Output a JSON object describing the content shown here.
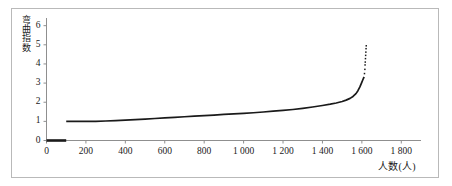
{
  "figure": {
    "background_color": "#ffffff",
    "frame_color": "#b9b9b9",
    "ink_color": "#1a1a1a"
  },
  "axes": {
    "x_title": "人数(人)",
    "y_title": "弯曲指数",
    "y_title_chars": [
      "弯",
      "曲",
      "指",
      "数"
    ],
    "x_tick_labels": [
      "0",
      "200",
      "400",
      "600",
      "800",
      "1 000",
      "1 200",
      "1 400",
      "1 600",
      "1 800"
    ],
    "y_tick_labels": [
      "0",
      "1",
      "2",
      "3",
      "4",
      "5",
      "6"
    ]
  },
  "chart_data": {
    "type": "line",
    "title": "",
    "subtitle": "",
    "xlabel": "人数(人)",
    "ylabel": "弯曲指数",
    "xlim": [
      0,
      1900
    ],
    "ylim": [
      0,
      6.4
    ],
    "xticks": [
      0,
      200,
      400,
      600,
      800,
      1000,
      1200,
      1400,
      1600,
      1800
    ],
    "xticklabels": [
      "0",
      "200",
      "400",
      "600",
      "800",
      "1 000",
      "1 200",
      "1 400",
      "1 600",
      "1 800"
    ],
    "yticks": [
      0,
      1,
      2,
      3,
      4,
      5,
      6
    ],
    "yticklabels": [
      "0",
      "1",
      "2",
      "3",
      "4",
      "5",
      "6"
    ],
    "grid": false,
    "legend": null,
    "legend_position": "none",
    "line_color": "#1a1a1a",
    "series": [
      {
        "name": "baseline-zero-segment",
        "style": "thick-solid",
        "x": [
          0,
          20,
          40,
          60,
          80,
          100
        ],
        "values": [
          0,
          0,
          0,
          0,
          0,
          0
        ]
      },
      {
        "name": "bending-index-curve",
        "style": "solid",
        "x": [
          100,
          150,
          200,
          250,
          300,
          350,
          400,
          450,
          500,
          550,
          600,
          650,
          700,
          750,
          800,
          850,
          900,
          950,
          1000,
          1050,
          1100,
          1150,
          1200,
          1250,
          1300,
          1350,
          1400,
          1440,
          1470,
          1500,
          1520,
          1540,
          1555,
          1570,
          1580,
          1590,
          1598,
          1604,
          1608,
          1612
        ],
        "values": [
          1.0,
          1.0,
          1.0,
          1.0,
          1.02,
          1.04,
          1.06,
          1.09,
          1.12,
          1.15,
          1.18,
          1.21,
          1.24,
          1.27,
          1.3,
          1.33,
          1.36,
          1.39,
          1.42,
          1.45,
          1.49,
          1.53,
          1.57,
          1.62,
          1.68,
          1.75,
          1.83,
          1.9,
          1.96,
          2.04,
          2.11,
          2.2,
          2.3,
          2.45,
          2.6,
          2.8,
          3.0,
          3.15,
          3.25,
          3.32
        ]
      },
      {
        "name": "upper-tail-scatter",
        "style": "dotted",
        "x": [
          1613,
          1615,
          1616,
          1617,
          1618,
          1619,
          1620,
          1621,
          1622
        ],
        "values": [
          3.5,
          3.72,
          3.95,
          4.1,
          4.28,
          4.45,
          4.62,
          4.8,
          4.95
        ]
      }
    ]
  }
}
